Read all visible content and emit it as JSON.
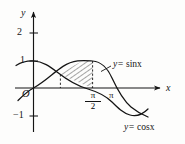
{
  "figure": {
    "type": "math-graph",
    "background": "#fdfdfc",
    "ink_color": "#141414",
    "axes": {
      "x_label": "x",
      "y_label": "y",
      "origin_label": "O",
      "y_ticks": [
        {
          "label": "2",
          "value": 2
        },
        {
          "label": "1",
          "value": 1
        },
        {
          "label": "−1",
          "value": -1
        }
      ],
      "x_ticks": [
        {
          "label_num": "π",
          "label_den": "2",
          "value": "pi/2",
          "is_fraction": true
        },
        {
          "label": "π",
          "value": "pi",
          "is_fraction": false
        }
      ]
    },
    "curves": [
      {
        "name": "sine-curve",
        "label_prefix": "y=",
        "label_fn": "sinx"
      },
      {
        "name": "cosine-curve",
        "label_prefix": "y=",
        "label_fn": "cosx"
      }
    ],
    "shaded_region": {
      "name": "hatched-area",
      "hatch": "diagonal",
      "from": "pi/4",
      "to": "pi/2",
      "upper": "sinx",
      "lower": "cosx"
    },
    "guides": [
      {
        "name": "dashed-guide-intersection",
        "at": "pi/4"
      },
      {
        "name": "dashed-guide-halfpi",
        "at": "pi/2"
      }
    ]
  }
}
